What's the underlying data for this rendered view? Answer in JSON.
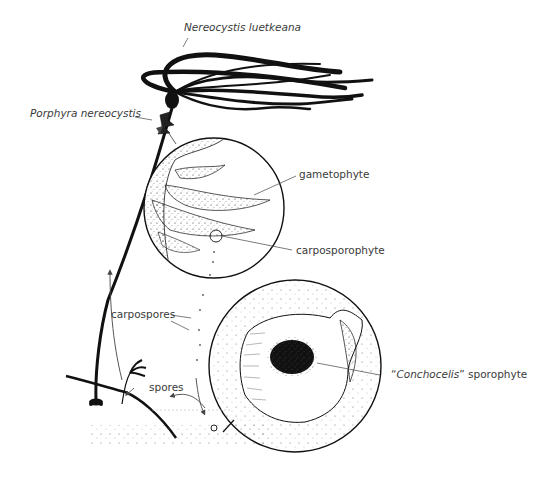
{
  "diagram": {
    "type": "life-cycle-illustration",
    "labels": {
      "kelp_species": "Nereocystis luetkeana",
      "epiphyte_species": "Porphyra nereocystis",
      "gametophyte": "gametophyte",
      "carposporophyte": "carposporophyte",
      "carpospores": "carpospores",
      "spores": "spores",
      "conchocelis_quote_open": "“",
      "conchocelis_name": "Conchocelis",
      "conchocelis_quote_close": "”",
      "conchocelis_suffix": " sporophyte"
    },
    "nodes": [
      {
        "id": "kelp",
        "label": "Nereocystis luetkeana",
        "style": "italic"
      },
      {
        "id": "epiphyte",
        "label": "Porphyra nereocystis",
        "style": "italic"
      },
      {
        "id": "magnified-blade",
        "label": "gametophyte"
      },
      {
        "id": "magnified-blade-detail",
        "label": "carposporophyte"
      },
      {
        "id": "shell-circle",
        "label": "“Conchocelis” sporophyte"
      }
    ],
    "arrows": [
      {
        "from": "carposporophyte",
        "to": "shell-circle",
        "label": "carpospores"
      },
      {
        "from": "shell-circle",
        "to": "kelp",
        "label": "spores"
      }
    ],
    "colors": {
      "ink": "#111111",
      "label": "#3a3a3a",
      "background": "#ffffff"
    }
  }
}
